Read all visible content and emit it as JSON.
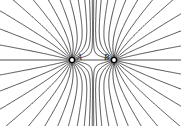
{
  "diagram": {
    "title": "",
    "charges": [
      {
        "label": "A",
        "x": 72,
        "y": 60
      },
      {
        "label": "B",
        "x": 114,
        "y": 60
      }
    ],
    "line_color": "#222222",
    "lines_per_charge": 26
  }
}
